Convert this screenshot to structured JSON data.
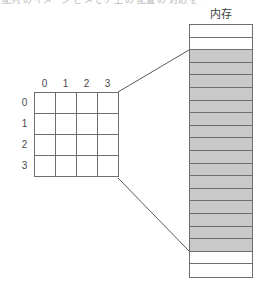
{
  "caption": {
    "truncated_top_text": "配列 の イメージ と メモリ 上 の 配置 の 対応 を 示す 図"
  },
  "memory": {
    "label": "内存",
    "total_cells": 20,
    "leading_empty_cells": 2,
    "filled_cells": 16,
    "trailing_empty_cells": 2,
    "fill_color": "#c9c9c9",
    "empty_color": "#ffffff",
    "border_color": "#6e6e6e"
  },
  "array_grid": {
    "column_headers": [
      "0",
      "1",
      "2",
      "3"
    ],
    "row_headers": [
      "0",
      "1",
      "2",
      "3"
    ],
    "rows": [
      [
        "",
        "",
        "",
        ""
      ],
      [
        "",
        "",
        "",
        ""
      ],
      [
        "",
        "",
        "",
        ""
      ],
      [
        "",
        "",
        "",
        ""
      ]
    ],
    "border_color": "#6e6e6e"
  },
  "connectors": {
    "top_line_label": "array-top-right-to-memory-start",
    "bottom_line_label": "array-bottom-right-to-memory-end",
    "color": "#5a5a5a"
  }
}
